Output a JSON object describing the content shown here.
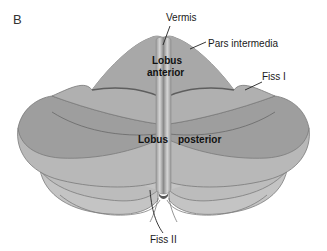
{
  "figure": {
    "panel_label": "B",
    "labels": {
      "vermis": "Vermis",
      "pars_intermedia": "Pars intermedia",
      "fiss_1": "Fiss I",
      "lobus_anterior_line1": "Lobus",
      "lobus_anterior_line2": "anterior",
      "lobus_posterior_word1": "Lobus",
      "lobus_posterior_word2": "posterior",
      "fiss_2": "Fiss II"
    },
    "colors": {
      "background": "#ffffff",
      "lobe_light": "#bdbdbd",
      "lobe_mid": "#aaaaaa",
      "lobe_dark": "#9a9a9a",
      "outline": "#7a7a7a",
      "fissure_line": "#5e5e5e",
      "vermis_light": "#d8d8d8",
      "vermis_dark": "#6a6a6a",
      "text": "#1a1a1a"
    }
  }
}
